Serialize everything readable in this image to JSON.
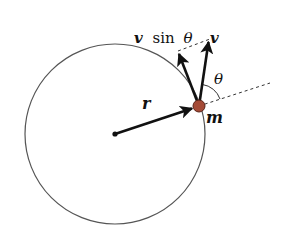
{
  "diagram": {
    "colors": {
      "background": "#ffffff",
      "circle": "#555555",
      "arrow": "#111111",
      "dashed": "#333333",
      "mass_fill": "#a44a36",
      "mass_stroke": "#5a2318"
    },
    "labels": {
      "v_sin_theta_v": "v",
      "v_sin_theta_sin": "sin",
      "v_sin_theta_theta": "θ",
      "v": "v",
      "theta": "θ",
      "r": "r",
      "m": "m"
    },
    "elements": {
      "circle": {
        "cx": 115,
        "cy": 134,
        "r": 90
      },
      "center_point": {
        "x": 115,
        "y": 134
      },
      "mass": {
        "x": 199,
        "y": 106,
        "r": 6
      },
      "r_vector": {
        "from": [
          115,
          134
        ],
        "to": [
          193,
          108
        ]
      },
      "v_vector": {
        "from": [
          199,
          106
        ],
        "to": [
          209,
          40
        ]
      },
      "v_sin_theta_vector": {
        "from": [
          199,
          106
        ],
        "to": [
          178,
          52
        ]
      },
      "projection_dashed": {
        "from": [
          178,
          52
        ],
        "to": [
          209,
          40
        ]
      },
      "radial_extension_dashed": {
        "from": [
          199,
          106
        ],
        "to": [
          270,
          83
        ]
      }
    }
  }
}
